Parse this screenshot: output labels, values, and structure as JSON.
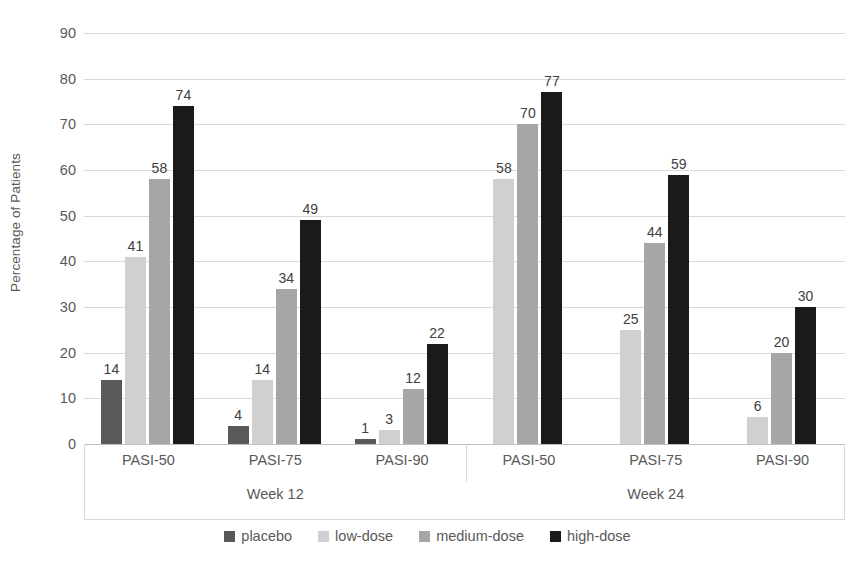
{
  "chart_data": {
    "type": "bar",
    "title": "",
    "xlabel": "",
    "ylabel": "Percentage of Patients",
    "ylim": [
      0,
      90
    ],
    "ytick_step": 10,
    "yticks": [
      90,
      80,
      70,
      60,
      50,
      40,
      30,
      20,
      10,
      0
    ],
    "grid": true,
    "legend_position": "bottom",
    "categories": [
      "PASI-50",
      "PASI-75",
      "PASI-90"
    ],
    "groups": [
      {
        "label": "Week 12",
        "categories": [
          "PASI-50",
          "PASI-75",
          "PASI-90"
        ],
        "series": [
          {
            "name": "placebo",
            "values": [
              14,
              4,
              1
            ]
          },
          {
            "name": "low-dose",
            "values": [
              41,
              14,
              3
            ]
          },
          {
            "name": "medium-dose",
            "values": [
              58,
              34,
              12
            ]
          },
          {
            "name": "high-dose",
            "values": [
              74,
              49,
              22
            ]
          }
        ]
      },
      {
        "label": "Week 24",
        "categories": [
          "PASI-50",
          "PASI-75",
          "PASI-90"
        ],
        "series": [
          {
            "name": "placebo",
            "values": [
              null,
              null,
              null
            ]
          },
          {
            "name": "low-dose",
            "values": [
              58,
              25,
              6
            ]
          },
          {
            "name": "medium-dose",
            "values": [
              70,
              44,
              20
            ]
          },
          {
            "name": "high-dose",
            "values": [
              77,
              59,
              30
            ]
          }
        ]
      }
    ],
    "series_colors": {
      "placebo": "#595959",
      "low-dose": "#d0d0d0",
      "medium-dose": "#a6a6a6",
      "high-dose": "#1a1a1a"
    },
    "legend": [
      {
        "label": "placebo",
        "color": "#595959"
      },
      {
        "label": "low-dose",
        "color": "#d0d0d0"
      },
      {
        "label": "medium-dose",
        "color": "#a6a6a6"
      },
      {
        "label": "high-dose",
        "color": "#1a1a1a"
      }
    ],
    "colors": {
      "gridline": "#d9d9d9",
      "axis_text": "#595959",
      "data_label": "#404040",
      "background": "#ffffff"
    }
  }
}
